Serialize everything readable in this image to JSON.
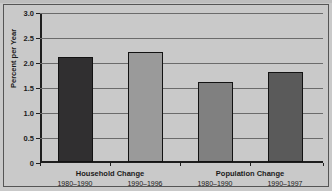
{
  "figure": {
    "background_color": "#c9c9c9",
    "frame_color": "#555555",
    "title_partial": ""
  },
  "chart_data": {
    "type": "bar",
    "title": "",
    "xlabel": "",
    "ylabel": "Percent per Year",
    "ylim": [
      0,
      3.0
    ],
    "ytick_labels": [
      "0",
      "0.5",
      "1.0",
      "1.5",
      "2.0",
      "2.5",
      "3.0"
    ],
    "ytick_values": [
      0,
      0.5,
      1.0,
      1.5,
      2.0,
      2.5,
      3.0
    ],
    "grid": true,
    "legend": false,
    "groups": [
      {
        "label": "Household Change"
      },
      {
        "label": "Population Change"
      }
    ],
    "categories": [
      "1980–1990",
      "1990–1996",
      "1980–1990",
      "1990–1997"
    ],
    "values": [
      2.1,
      2.2,
      1.6,
      1.8
    ],
    "bar_colors": [
      "#302f30",
      "#9a9a9a",
      "#808080",
      "#5a5a5a"
    ],
    "bars": [
      {
        "group": "Household Change",
        "category": "1980–1990",
        "value": 2.1,
        "color": "#302f30"
      },
      {
        "group": "Household Change",
        "category": "1990–1996",
        "value": 2.2,
        "color": "#9a9a9a"
      },
      {
        "group": "Population Change",
        "category": "1980–1990",
        "value": 1.6,
        "color": "#808080"
      },
      {
        "group": "Population Change",
        "category": "1990–1997",
        "value": 1.8,
        "color": "#5a5a5a"
      }
    ]
  }
}
